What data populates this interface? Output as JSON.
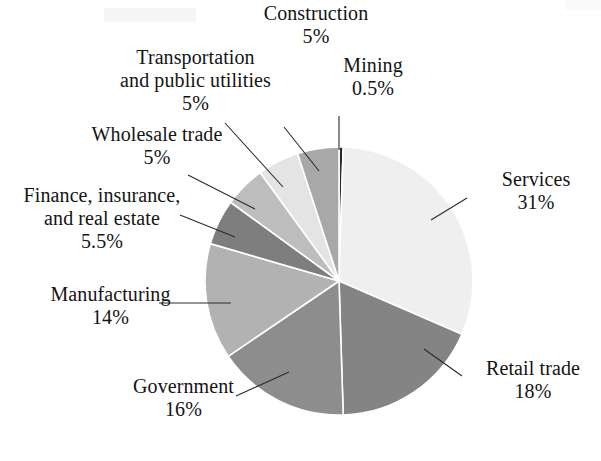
{
  "figure": {
    "background_color": "#ffffff",
    "text_color": "#141414",
    "leader_line_color": "#2b2b2b"
  },
  "chart_data": {
    "type": "pie",
    "title": "",
    "subtitle": "",
    "xlabel": "",
    "ylabel": "",
    "legend_position": "callout-labels",
    "grid": false,
    "start_angle_deg": 0,
    "direction": "clockwise",
    "units": "percent",
    "total": 100,
    "categories": [
      "Mining",
      "Services",
      "Retail trade",
      "Government",
      "Manufacturing",
      "Finance, insurance, and real estate",
      "Wholesale trade",
      "Transportation and public utilities",
      "Construction"
    ],
    "values": [
      0.5,
      31,
      18,
      16,
      14,
      5.5,
      5,
      5,
      5
    ],
    "slices": [
      {
        "id": "mining",
        "name": "Mining",
        "name_lines": [
          "Mining"
        ],
        "value": 0.5,
        "percent_label": "0.5%",
        "color": "#2a2a2a",
        "start_angle_deg": 0,
        "end_angle_deg": 1.8
      },
      {
        "id": "services",
        "name": "Services",
        "name_lines": [
          "Services"
        ],
        "value": 31,
        "percent_label": "31%",
        "color": "#efefef",
        "start_angle_deg": 1.8,
        "end_angle_deg": 113.4
      },
      {
        "id": "retail-trade",
        "name": "Retail trade",
        "name_lines": [
          "Retail trade"
        ],
        "value": 18,
        "percent_label": "18%",
        "color": "#848484",
        "start_angle_deg": 113.4,
        "end_angle_deg": 178.2
      },
      {
        "id": "government",
        "name": "Government",
        "name_lines": [
          "Government"
        ],
        "value": 16,
        "percent_label": "16%",
        "color": "#8d8d8d",
        "start_angle_deg": 178.2,
        "end_angle_deg": 235.8
      },
      {
        "id": "manufacturing",
        "name": "Manufacturing",
        "name_lines": [
          "Manufacturing"
        ],
        "value": 14,
        "percent_label": "14%",
        "color": "#b2b2b2",
        "start_angle_deg": 235.8,
        "end_angle_deg": 286.2
      },
      {
        "id": "finance-insurance-real-estate",
        "name": "Finance, insurance, and real estate",
        "name_lines": [
          "Finance, insurance,",
          "and real estate"
        ],
        "value": 5.5,
        "percent_label": "5.5%",
        "color": "#7e7e7e",
        "start_angle_deg": 286.2,
        "end_angle_deg": 306.0
      },
      {
        "id": "wholesale-trade",
        "name": "Wholesale trade",
        "name_lines": [
          "Wholesale trade"
        ],
        "value": 5,
        "percent_label": "5%",
        "color": "#bdbdbd",
        "start_angle_deg": 306.0,
        "end_angle_deg": 324.0
      },
      {
        "id": "transportation-public-utilities",
        "name": "Transportation and public utilities",
        "name_lines": [
          "Transportation",
          "and public utilities"
        ],
        "value": 5,
        "percent_label": "5%",
        "color": "#e4e4e4",
        "start_angle_deg": 324.0,
        "end_angle_deg": 342.0
      },
      {
        "id": "construction",
        "name": "Construction",
        "name_lines": [
          "Construction"
        ],
        "value": 5,
        "percent_label": "5%",
        "color": "#a8a8a8",
        "start_angle_deg": 342.0,
        "end_angle_deg": 360.0
      }
    ],
    "geometry": {
      "center_x": 339,
      "center_y": 281,
      "radius": 134
    }
  },
  "labels": {
    "construction": {
      "name": "Construction",
      "percent": "5%"
    },
    "mining": {
      "name": "Mining",
      "percent": "0.5%"
    },
    "transportation": {
      "line1": "Transportation",
      "line2": "and public utilities",
      "percent": "5%"
    },
    "wholesale": {
      "name": "Wholesale trade",
      "percent": "5%"
    },
    "finance": {
      "line1": "Finance, insurance,",
      "line2": "and real estate",
      "percent": "5.5%"
    },
    "manufacturing": {
      "name": "Manufacturing",
      "percent": "14%"
    },
    "government": {
      "name": "Government",
      "percent": "16%"
    },
    "services": {
      "name": "Services",
      "percent": "31%"
    },
    "retail": {
      "name": "Retail trade",
      "percent": "18%"
    }
  }
}
